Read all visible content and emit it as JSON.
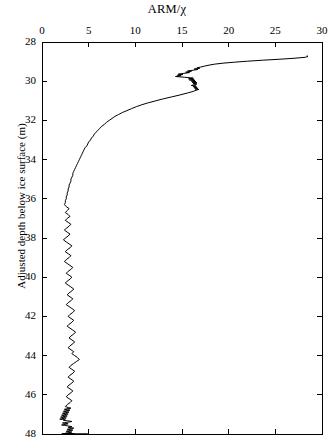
{
  "chart_data": {
    "type": "line",
    "title": "ARM/χ",
    "xlabel": "ARM/χ",
    "ylabel": "Adjusted depth below ice surface (m)",
    "xlim": [
      0,
      30
    ],
    "ylim": [
      28,
      48
    ],
    "y_inverted": true,
    "grid": false,
    "legend": null,
    "xticks": [
      0,
      5,
      10,
      15,
      20,
      25,
      30
    ],
    "yticks": [
      28,
      30,
      32,
      34,
      36,
      38,
      40,
      42,
      44,
      46,
      48
    ],
    "xtick_labels": [
      "0",
      "5",
      "10",
      "15",
      "20",
      "25",
      "30"
    ],
    "ytick_labels": [
      "28",
      "30",
      "32",
      "34",
      "36",
      "38",
      "40",
      "42",
      "44",
      "46",
      "48"
    ],
    "line_color": "#000000",
    "line_width": 1.0,
    "series": [
      {
        "name": "ARM/χ profile",
        "x": [
          28.4,
          28.5,
          28.2,
          27.0,
          25.4,
          23.6,
          22.0,
          20.6,
          19.4,
          18.5,
          17.9,
          17.4,
          17.0,
          16.6,
          16.9,
          16.3,
          16.7,
          16.2,
          15.6,
          16.0,
          15.4,
          15.8,
          15.2,
          14.6,
          15.1,
          14.5,
          14.9,
          14.3,
          14.8,
          15.3,
          16.2,
          15.7,
          16.3,
          15.8,
          16.4,
          16.0,
          16.5,
          16.1,
          16.6,
          16.2,
          16.6,
          16.3,
          16.0,
          16.5,
          16.2,
          16.6,
          16.3,
          16.7,
          16.4,
          16.8,
          16.5,
          16.2,
          15.6,
          14.8,
          13.9,
          13.0,
          12.2,
          11.4,
          10.7,
          10.1,
          9.6,
          9.1,
          8.6,
          8.2,
          7.8,
          7.5,
          7.2,
          6.9,
          6.7,
          6.4,
          6.2,
          6.0,
          5.8,
          5.6,
          5.5,
          5.3,
          5.2,
          5.0,
          4.9,
          4.8,
          4.6,
          4.5,
          4.4,
          4.3,
          4.2,
          4.1,
          4.0,
          3.9,
          3.8,
          3.7,
          3.6,
          3.5,
          3.4,
          3.3,
          3.3,
          3.2,
          3.1,
          3.1,
          3.0,
          2.9,
          2.9,
          2.8,
          2.8,
          2.7,
          2.7,
          2.6,
          2.6,
          2.5,
          2.5,
          2.4,
          2.6,
          2.9,
          2.7,
          2.5,
          2.8,
          3.0,
          2.7,
          2.5,
          2.8,
          3.1,
          2.9,
          2.6,
          2.4,
          2.7,
          3.0,
          2.8,
          2.5,
          2.3,
          2.6,
          2.9,
          3.2,
          3.0,
          2.7,
          2.5,
          2.8,
          3.1,
          2.9,
          2.6,
          2.4,
          2.7,
          3.0,
          3.3,
          3.1,
          2.8,
          2.6,
          2.9,
          3.2,
          3.0,
          2.7,
          2.5,
          2.8,
          3.1,
          3.4,
          3.2,
          2.9,
          2.7,
          3.0,
          3.3,
          3.1,
          2.8,
          2.6,
          2.9,
          3.2,
          3.5,
          3.3,
          3.0,
          2.8,
          3.1,
          3.4,
          3.2,
          2.9,
          2.7,
          3.0,
          3.3,
          3.6,
          3.4,
          3.1,
          2.9,
          3.2,
          3.5,
          3.3,
          3.0,
          2.8,
          3.1,
          3.4,
          3.2,
          3.5,
          3.8,
          4.0,
          3.7,
          3.4,
          3.1,
          2.9,
          3.2,
          3.5,
          3.3,
          3.0,
          2.8,
          3.1,
          3.4,
          3.2,
          2.9,
          2.7,
          3.0,
          3.3,
          3.1,
          2.8,
          2.6,
          2.9,
          3.2,
          3.0,
          2.7,
          2.5,
          2.8,
          3.1,
          2.9,
          2.6,
          2.4,
          2.7,
          3.0,
          2.8,
          2.5,
          2.3,
          2.6,
          2.9,
          2.7,
          2.4,
          2.2,
          2.5,
          2.8,
          2.6,
          2.3,
          2.1,
          2.4,
          2.7,
          2.5,
          2.2,
          2.0,
          2.3,
          2.6,
          2.4,
          2.1,
          1.9,
          2.2,
          2.5,
          2.3,
          2.6,
          2.9,
          3.2,
          3.0,
          2.7,
          2.4,
          2.2,
          2.5,
          2.8,
          2.6,
          2.3,
          2.1,
          2.4,
          2.7,
          2.9,
          3.2,
          3.0,
          2.8,
          3.1,
          3.4,
          3.2,
          2.9,
          2.7,
          3.0,
          3.3,
          3.1,
          2.8,
          2.6,
          2.9,
          3.2,
          3.0,
          2.7,
          2.5,
          2.8,
          3.1,
          2.9,
          3.2,
          3.5,
          3.3,
          3.0,
          2.8,
          3.1,
          3.4,
          3.2,
          2.9,
          2.7,
          3.0,
          3.3,
          3.1,
          2.8,
          2.6,
          2.9,
          3.2,
          3.0,
          2.7,
          2.5,
          2.8,
          3.1,
          2.9,
          2.6,
          2.4,
          2.7,
          3.0,
          2.8,
          2.5,
          2.3,
          2.6,
          2.9,
          2.7,
          2.4,
          2.2,
          2.5,
          2.8,
          2.6,
          2.3,
          2.1,
          2.4,
          2.7,
          2.5,
          2.8,
          3.1,
          3.4,
          3.7,
          4.0,
          4.3,
          4.6,
          4.9,
          4.6,
          4.2,
          3.8,
          3.4,
          3.0,
          2.7,
          2.4,
          2.2,
          2.5,
          2.8,
          3.1,
          2.9,
          2.6,
          2.4,
          2.7,
          3.0,
          3.3,
          3.1,
          2.8,
          2.6,
          2.9,
          3.2,
          3.0,
          2.7,
          2.5,
          2.8,
          3.1
        ],
        "y": [
          28.7,
          28.74,
          28.78,
          28.83,
          28.88,
          28.93,
          28.98,
          29.03,
          29.08,
          29.13,
          29.18,
          29.23,
          29.28,
          29.32,
          29.34,
          29.38,
          29.4,
          29.44,
          29.48,
          29.5,
          29.54,
          29.56,
          29.6,
          29.64,
          29.66,
          29.7,
          29.72,
          29.76,
          29.78,
          29.8,
          29.84,
          29.88,
          29.9,
          29.94,
          29.96,
          30.0,
          30.02,
          30.06,
          30.08,
          30.12,
          30.14,
          30.18,
          30.22,
          30.24,
          30.28,
          30.3,
          30.34,
          30.36,
          30.4,
          30.42,
          30.46,
          30.52,
          30.6,
          30.7,
          30.8,
          30.9,
          31.0,
          31.1,
          31.2,
          31.3,
          31.4,
          31.5,
          31.6,
          31.7,
          31.8,
          31.9,
          32.0,
          32.1,
          32.2,
          32.3,
          32.4,
          32.5,
          32.6,
          32.7,
          32.8,
          32.9,
          33.0,
          33.1,
          33.2,
          33.3,
          33.4,
          33.5,
          33.6,
          33.7,
          33.8,
          33.9,
          34.0,
          34.1,
          34.2,
          34.3,
          34.4,
          34.5,
          34.6,
          34.7,
          34.8,
          34.9,
          35.0,
          35.1,
          35.2,
          35.3,
          35.4,
          35.5,
          35.6,
          35.7,
          35.8,
          35.9,
          36.0,
          36.1,
          36.2,
          36.3,
          36.4,
          36.5,
          36.6,
          36.7,
          36.8,
          36.9,
          37.0,
          37.1,
          37.2,
          37.3,
          37.4,
          37.5,
          37.6,
          37.7,
          37.8,
          37.9,
          38.0,
          38.1,
          38.2,
          38.3,
          38.4,
          38.5,
          38.6,
          38.7,
          38.8,
          38.9,
          39.0,
          39.1,
          39.2,
          39.3,
          39.4,
          39.5,
          39.6,
          39.7,
          39.8,
          39.9,
          40.0,
          40.1,
          40.2,
          40.3,
          40.4,
          40.5,
          40.6,
          40.7,
          40.8,
          40.9,
          41.0,
          41.1,
          41.2,
          41.3,
          41.4,
          41.5,
          41.6,
          41.7,
          41.8,
          41.9,
          42.0,
          42.1,
          42.2,
          42.3,
          42.4,
          42.5,
          42.6,
          42.7,
          42.8,
          42.9,
          43.0,
          43.1,
          43.2,
          43.3,
          43.4,
          43.5,
          43.6,
          43.7,
          43.8,
          43.9,
          44.0,
          44.1,
          44.2,
          44.3,
          44.4,
          44.5,
          44.6,
          44.7,
          44.8,
          44.9,
          45.0,
          45.1,
          45.2,
          45.3,
          45.4,
          45.5,
          45.6,
          45.7,
          45.8,
          45.9,
          46.0,
          46.1,
          46.2,
          46.3,
          46.4,
          46.5,
          46.6,
          46.65,
          46.68,
          46.7,
          46.72,
          46.74,
          46.76,
          46.78,
          46.8,
          46.82,
          46.84,
          46.86,
          46.88,
          46.9,
          46.92,
          46.94,
          46.96,
          46.98,
          47.0,
          47.02,
          47.04,
          47.06,
          47.08,
          47.1,
          47.12,
          47.14,
          47.16,
          47.18,
          47.2,
          47.22,
          47.24,
          47.26,
          47.28,
          47.3,
          47.32,
          47.34,
          47.36,
          47.38,
          47.4,
          47.42,
          47.44,
          47.46,
          47.48,
          47.5,
          47.52,
          47.54,
          47.56,
          47.58,
          47.6,
          47.62,
          47.64,
          47.66,
          47.68,
          47.7,
          47.72,
          47.74,
          47.76,
          47.78,
          47.8,
          47.82,
          47.84,
          47.86,
          47.88,
          47.9,
          47.92,
          47.94,
          47.96,
          47.98,
          48.0,
          48.0,
          48.0,
          48.0,
          48.0,
          48.0,
          48.0,
          48.0,
          48.0,
          48.0,
          48.0,
          48.0,
          48.0,
          48.0,
          48.0,
          48.0,
          48.0,
          48.0,
          48.0,
          48.0,
          48.0,
          48.0,
          48.0,
          48.0,
          48.0,
          48.0,
          48.0,
          48.0,
          48.0,
          48.0,
          48.0,
          48.0,
          48.0,
          48.0,
          48.0,
          48.0,
          48.0,
          48.0,
          48.0,
          48.0,
          48.0,
          48.0,
          48.0,
          48.0,
          48.0,
          48.0,
          48.0,
          48.0,
          48.0,
          48.0,
          48.0,
          48.0,
          48.0,
          48.0,
          48.0,
          48.0,
          48.0,
          48.0,
          48.0,
          48.0,
          48.0,
          48.0,
          48.0,
          48.0,
          48.0,
          48.0,
          48.0,
          48.0,
          48.0,
          48.0,
          48.0,
          48.0,
          48.0,
          48.0,
          48.0,
          48.0,
          48.0,
          48.0,
          48.0,
          48.0
        ]
      }
    ]
  },
  "plot_geometry": {
    "left_px": 42,
    "right_px": 322,
    "top_px": 42,
    "bottom_px": 434
  }
}
